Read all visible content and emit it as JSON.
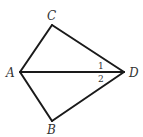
{
  "figure": {
    "type": "geometry-diagram",
    "stroke_color": "#1a1a1a",
    "label_color": "#333333",
    "vertices": {
      "A": {
        "label": "A"
      },
      "B": {
        "label": "B"
      },
      "C": {
        "label": "C"
      },
      "D": {
        "label": "D"
      }
    },
    "segments": [
      {
        "from": "A",
        "to": "C"
      },
      {
        "from": "C",
        "to": "D"
      },
      {
        "from": "A",
        "to": "D"
      },
      {
        "from": "A",
        "to": "B"
      },
      {
        "from": "B",
        "to": "D"
      }
    ],
    "angle_labels": [
      {
        "label": "1",
        "vertex": "D",
        "between": [
          "C",
          "A"
        ]
      },
      {
        "label": "2",
        "vertex": "D",
        "between": [
          "A",
          "B"
        ]
      }
    ]
  }
}
